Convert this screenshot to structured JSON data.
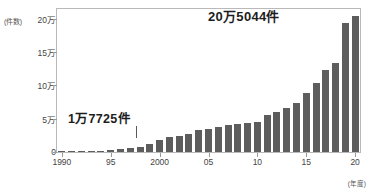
{
  "chart_data": {
    "type": "bar",
    "title": "",
    "subtitle": "",
    "xlabel": "年度",
    "ylabel": "件数",
    "y_unit_label": "(件数)",
    "x_unit_label": "(年度)",
    "ylim": [
      0,
      215000
    ],
    "yticks": [
      0,
      50000,
      100000,
      150000,
      200000
    ],
    "ytick_labels": [
      "0",
      "5万",
      "10万",
      "15万",
      "20万"
    ],
    "xtick_years": [
      1990,
      1995,
      2000,
      2005,
      2010,
      2015,
      2020
    ],
    "xtick_labels": [
      "1990",
      "95",
      "2000",
      "05",
      "10",
      "15",
      "20"
    ],
    "grid": false,
    "legend": "none",
    "bar_color": "#5d5d5d",
    "categories": [
      1990,
      1991,
      1992,
      1993,
      1994,
      1995,
      1996,
      1997,
      1998,
      1999,
      2000,
      2001,
      2002,
      2003,
      2004,
      2005,
      2006,
      2007,
      2008,
      2009,
      2010,
      2011,
      2012,
      2013,
      2014,
      2015,
      2016,
      2017,
      2018,
      2019,
      2020
    ],
    "values": [
      1101,
      1171,
      1372,
      1611,
      1961,
      2722,
      4102,
      5352,
      6932,
      11631,
      17725,
      23274,
      23738,
      26569,
      33408,
      34472,
      37323,
      40639,
      42664,
      44211,
      44807,
      56384,
      59919,
      66701,
      73802,
      88931,
      103260,
      122578,
      133778,
      193780,
      205044
    ],
    "annotations": [
      {
        "name": "min-annotation",
        "label": "1万7725件",
        "year": 2000,
        "value": 17725
      },
      {
        "name": "max-annotation",
        "label": "20万5044件",
        "year": 2020,
        "value": 205044
      }
    ]
  },
  "axes": {
    "y_unit": "(件数)",
    "x_unit": "(年度)"
  }
}
